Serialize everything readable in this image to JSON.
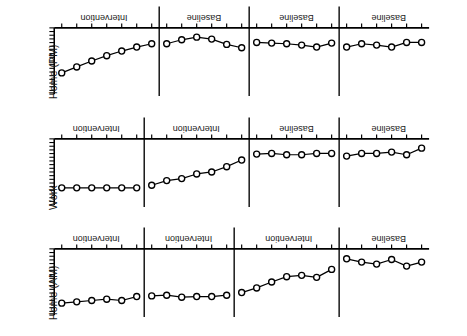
{
  "figure": {
    "rotation_degrees": 180,
    "orientation_note": "figure printed upside down",
    "background": "#ffffff",
    "ink": "#000000"
  },
  "chart_data": {
    "type": "line",
    "title": "",
    "xlabel": "",
    "ylabel": "",
    "grid": false,
    "legend": "none",
    "marker": "open-circle",
    "x": [
      1,
      2,
      3,
      4,
      5,
      6,
      7,
      8,
      9,
      10,
      11,
      12,
      13,
      14,
      15,
      16,
      17,
      18,
      19,
      20,
      21,
      22,
      23,
      24,
      25
    ],
    "xlim": [
      0.5,
      25.5
    ],
    "ylim": [
      0,
      10
    ],
    "panels": [
      {
        "name": "home-am",
        "axis_label": "Home (AM)",
        "phases": [
          {
            "label": "Baseline",
            "start": 1,
            "end": 6
          },
          {
            "label": "Intervention",
            "start": 7,
            "end": 13
          },
          {
            "label": "Intervention",
            "start": 14,
            "end": 19
          },
          {
            "label": "Intervention",
            "start": 20,
            "end": 25
          }
        ],
        "phase_breaks": [
          6.5,
          13.5,
          19.5
        ],
        "values": [
          2.0,
          2.6,
          1.6,
          2.3,
          2.0,
          1.5,
          3.1,
          4.3,
          4.0,
          4.2,
          5.0,
          5.9,
          6.6,
          7.0,
          7.2,
          7.2,
          7.3,
          7.0,
          7.1,
          7.2,
          7.8,
          7.6,
          7.8,
          8.0,
          8.2
        ]
      },
      {
        "name": "work",
        "axis_label": "Work",
        "phases": [
          {
            "label": "Baseline",
            "start": 1,
            "end": 6
          },
          {
            "label": "Baseline",
            "start": 7,
            "end": 12
          },
          {
            "label": "Intervention",
            "start": 13,
            "end": 19
          },
          {
            "label": "Intervention",
            "start": 20,
            "end": 25
          }
        ],
        "phase_breaks": [
          6.5,
          12.5,
          19.5
        ],
        "values": [
          1.4,
          2.4,
          2.0,
          2.2,
          2.2,
          2.6,
          2.2,
          2.2,
          2.4,
          2.4,
          2.2,
          2.3,
          3.2,
          4.2,
          5.0,
          5.3,
          6.0,
          6.3,
          7.0,
          7.4,
          7.4,
          7.4,
          7.4,
          7.4,
          7.4
        ]
      },
      {
        "name": "home-pm",
        "axis_label": "Home (PM)",
        "phases": [
          {
            "label": "Baseline",
            "start": 1,
            "end": 6
          },
          {
            "label": "Baseline",
            "start": 7,
            "end": 12
          },
          {
            "label": "Baseline",
            "start": 13,
            "end": 18
          },
          {
            "label": "Intervention",
            "start": 19,
            "end": 25
          }
        ],
        "phase_breaks": [
          6.5,
          12.5,
          18.5
        ],
        "values": [
          2.2,
          2.2,
          2.9,
          2.6,
          2.4,
          2.9,
          2.3,
          2.9,
          2.6,
          2.4,
          2.3,
          2.2,
          3.0,
          2.5,
          1.7,
          1.4,
          1.8,
          2.4,
          2.4,
          2.9,
          3.5,
          4.2,
          5.0,
          5.9,
          6.8
        ]
      }
    ]
  }
}
